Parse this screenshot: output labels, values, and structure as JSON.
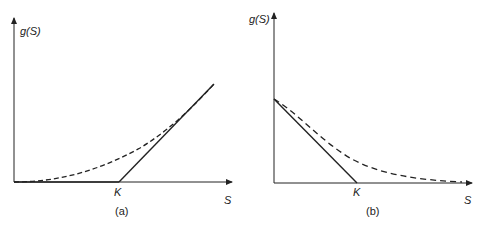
{
  "panels": [
    {
      "id": "a",
      "caption": "(a)",
      "y_label": "g(S)",
      "x_label": "S",
      "strike_label": "K",
      "description": "Call payoff: solid hockey-stick max(S-K,0); dashed smooth convex curve above it"
    },
    {
      "id": "b",
      "caption": "(b)",
      "y_label": "g(S)",
      "x_label": "S",
      "strike_label": "K",
      "description": "Put payoff: solid line max(K-S,0); dashed smooth convex curve above it"
    }
  ],
  "colors": {
    "line": "#222222",
    "background": "#ffffff"
  }
}
